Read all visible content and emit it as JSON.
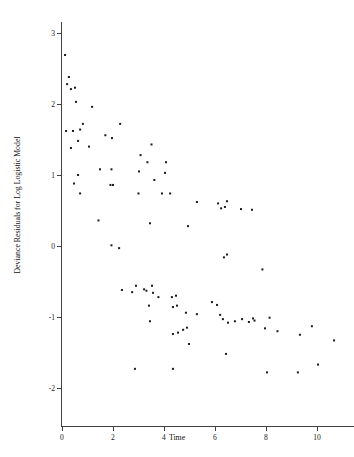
{
  "chart_data": {
    "type": "scatter",
    "title": "",
    "xlabel": "Time",
    "ylabel": "Deviance Residuals for Log Logistic Model",
    "xlim": [
      -0.55,
      11.45
    ],
    "ylim": [
      -2.35,
      3.15
    ],
    "xticks": [
      0,
      2,
      4,
      6,
      8,
      10
    ],
    "xtick_labels": [
      "0",
      "2",
      "4",
      "6",
      "8",
      "10"
    ],
    "yticks": [
      3,
      2,
      1,
      0,
      -1,
      -2
    ],
    "ytick_labels": [
      "3",
      "2",
      "1",
      "0",
      "-1",
      "-2"
    ],
    "grid": false,
    "legend": null,
    "marker": "square",
    "marker_color": "#1b1b1b",
    "marker_size": 2.0,
    "n_points": 104,
    "points": [
      [
        0.12,
        2.69
      ],
      [
        0.2,
        2.28
      ],
      [
        0.27,
        2.38
      ],
      [
        0.35,
        2.21
      ],
      [
        0.51,
        2.23
      ],
      [
        0.55,
        2.03
      ],
      [
        1.18,
        1.96
      ],
      [
        0.16,
        1.62
      ],
      [
        0.43,
        1.62
      ],
      [
        0.71,
        1.64
      ],
      [
        0.82,
        1.72
      ],
      [
        2.28,
        1.72
      ],
      [
        1.7,
        1.56
      ],
      [
        1.96,
        1.52
      ],
      [
        0.63,
        1.48
      ],
      [
        0.35,
        1.38
      ],
      [
        1.06,
        1.4
      ],
      [
        3.51,
        1.43
      ],
      [
        3.08,
        1.28
      ],
      [
        3.35,
        1.18
      ],
      [
        4.08,
        1.18
      ],
      [
        1.49,
        1.08
      ],
      [
        1.94,
        1.08
      ],
      [
        3.02,
        1.05
      ],
      [
        4.04,
        1.03
      ],
      [
        0.63,
        1.0
      ],
      [
        3.62,
        0.93
      ],
      [
        0.47,
        0.88
      ],
      [
        1.9,
        0.86
      ],
      [
        2.0,
        0.86
      ],
      [
        0.71,
        0.74
      ],
      [
        3.0,
        0.74
      ],
      [
        3.92,
        0.74
      ],
      [
        4.24,
        0.74
      ],
      [
        5.29,
        0.62
      ],
      [
        6.12,
        0.6
      ],
      [
        6.47,
        0.63
      ],
      [
        6.24,
        0.53
      ],
      [
        6.39,
        0.55
      ],
      [
        7.02,
        0.52
      ],
      [
        7.45,
        0.51
      ],
      [
        1.43,
        0.36
      ],
      [
        3.45,
        0.32
      ],
      [
        4.94,
        0.28
      ],
      [
        1.94,
        0.01
      ],
      [
        2.24,
        -0.03
      ],
      [
        6.35,
        -0.16
      ],
      [
        6.47,
        -0.12
      ],
      [
        7.86,
        -0.33
      ],
      [
        2.35,
        -0.62
      ],
      [
        2.9,
        -0.56
      ],
      [
        3.22,
        -0.61
      ],
      [
        2.75,
        -0.65
      ],
      [
        3.31,
        -0.63
      ],
      [
        3.53,
        -0.56
      ],
      [
        3.57,
        -0.66
      ],
      [
        3.78,
        -0.72
      ],
      [
        4.31,
        -0.72
      ],
      [
        4.47,
        -0.7
      ],
      [
        3.41,
        -0.84
      ],
      [
        4.35,
        -0.86
      ],
      [
        4.51,
        -0.84
      ],
      [
        5.88,
        -0.79
      ],
      [
        6.08,
        -0.83
      ],
      [
        4.86,
        -0.94
      ],
      [
        5.29,
        -0.96
      ],
      [
        6.2,
        -0.97
      ],
      [
        3.45,
        -1.06
      ],
      [
        6.31,
        -1.03
      ],
      [
        6.51,
        -1.08
      ],
      [
        6.78,
        -1.06
      ],
      [
        7.06,
        -1.03
      ],
      [
        7.33,
        -1.07
      ],
      [
        7.49,
        -1.02
      ],
      [
        7.55,
        -1.05
      ],
      [
        8.14,
        -1.01
      ],
      [
        4.35,
        -1.24
      ],
      [
        4.55,
        -1.22
      ],
      [
        4.75,
        -1.18
      ],
      [
        4.9,
        -1.15
      ],
      [
        7.96,
        -1.16
      ],
      [
        8.45,
        -1.2
      ],
      [
        9.33,
        -1.25
      ],
      [
        9.8,
        -1.13
      ],
      [
        10.67,
        -1.33
      ],
      [
        4.98,
        -1.38
      ],
      [
        6.43,
        -1.52
      ],
      [
        2.86,
        -1.73
      ],
      [
        4.35,
        -1.73
      ],
      [
        8.04,
        -1.78
      ],
      [
        9.25,
        -1.78
      ],
      [
        10.04,
        -1.67
      ]
    ]
  },
  "axes": {
    "x_axis_name": "time-axis",
    "y_axis_name": "deviance-residual-axis"
  }
}
